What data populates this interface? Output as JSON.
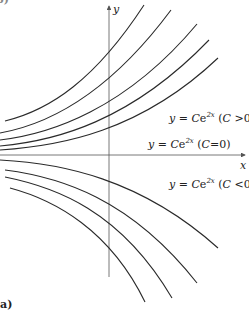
{
  "figure": {
    "panel_label": "a)",
    "top_fragment": "b)",
    "axes": {
      "x_label": "x",
      "y_label": "y"
    },
    "annotations": [
      {
        "lhs": "y",
        "eq": " = ",
        "C": "C",
        "base": "e",
        "exp": "2x",
        "cond_open": " (",
        "cond_var": "C",
        "cond": " >0)",
        "name": "label-c-positive"
      },
      {
        "lhs": "y",
        "eq": " = ",
        "C": "C",
        "base": "e",
        "exp": "2x",
        "cond_open": " (",
        "cond_var": "C",
        "cond": "=0)",
        "name": "label-c-zero"
      },
      {
        "lhs": "y",
        "eq": " = ",
        "C": "C",
        "base": "e",
        "exp": "2x",
        "cond_open": " (",
        "cond_var": "C",
        "cond": " <0)",
        "name": "label-c-negative"
      }
    ],
    "curve_family": {
      "equation": "y = Ce^{2x}",
      "positive_curves": 5,
      "negative_curves": 4,
      "zero_curve": "x-axis"
    },
    "colors": {
      "curve": "#2a2a2a",
      "axis": "#555555",
      "text": "#222222"
    }
  }
}
